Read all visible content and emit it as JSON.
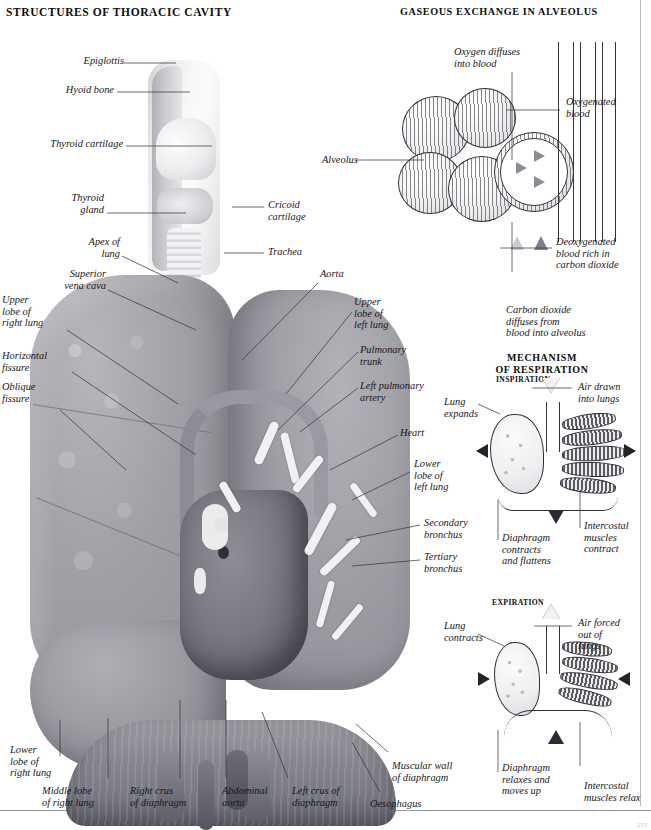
{
  "page": {
    "title_left": "STRUCTURES OF THORACIC CAVITY",
    "title_right": "GASEOUS EXCHANGE IN ALVEOLUS",
    "page_number": "253"
  },
  "mechanism": {
    "heading": "MECHANISM\nOF RESPIRATION",
    "inspiration_heading": "INSPIRATION",
    "expiration_heading": "EXPIRATION",
    "inspiration_labels": {
      "lung": "Lung\nexpands",
      "air": "Air drawn\ninto lungs",
      "diaphragm": "Diaphragm\ncontracts\nand flattens",
      "intercostal": "Intercostal\nmuscles\ncontract"
    },
    "expiration_labels": {
      "lung": "Lung\ncontracts",
      "air": "Air forced\nout of\nlungs",
      "diaphragm": "Diaphragm\nrelaxes and\nmoves up",
      "intercostal": "Intercostal\nmuscles relax"
    }
  },
  "alveolus_labels": {
    "oxygen_diffuses": "Oxygen diffuses\ninto blood",
    "oxygenated_blood": "Oxygenated\nblood",
    "alveolus": "Alveolus",
    "deoxygenated": "Deoxygenated\nblood rich in\ncarbon dioxide",
    "carbon_dioxide": "Carbon dioxide\ndiffuses from\nblood into alveolus"
  },
  "thorax_labels": {
    "epiglottis": "Epiglottis",
    "hyoid_bone": "Hyoid bone",
    "thyroid_cartilage": "Thyroid cartilage",
    "thyroid_gland": "Thyroid\ngland",
    "apex_of_lung": "Apex of\nlung",
    "superior_vena_cava": "Superior\nvena cava",
    "upper_lobe_right": "Upper\nlobe of\nright lung",
    "horizontal_fissure": "Horizontal\nfissure",
    "oblique_fissure": "Oblique\nfissure",
    "cricoid_cartilage": "Cricoid\ncartilage",
    "trachea": "Trachea",
    "aorta": "Aorta",
    "upper_lobe_left": "Upper\nlobe of\nleft lung",
    "pulmonary_trunk": "Pulmonary\ntrunk",
    "left_pulmonary_artery": "Left pulmonary\nartery",
    "heart": "Heart",
    "lower_lobe_left": "Lower\nlobe of\nleft lung",
    "secondary_bronchus": "Secondary\nbronchus",
    "tertiary_bronchus": "Tertiary\nbronchus",
    "lower_lobe_right": "Lower\nlobe of\nright lung",
    "middle_lobe_right": "Middle lobe\nof right lung",
    "right_crus": "Right crus\nof diaphragm",
    "abdominal_aorta": "Abdominal\naorta",
    "left_crus": "Left crus of\ndiaphragm",
    "oesophagus": "Oesophagus",
    "muscular_wall": "Muscular wall\nof diaphragm"
  },
  "colors": {
    "ink": "#17171a",
    "rule": "#9a9aa0",
    "tissue": "#9c9ca3"
  }
}
